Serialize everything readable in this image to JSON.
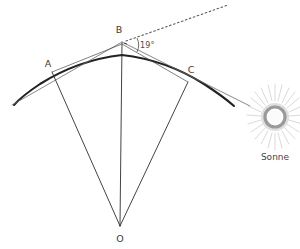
{
  "diagram": {
    "background_color": "#ffffff",
    "line_color": "#2b2b2b",
    "thin_line_color": "#555555",
    "label_color": "#3a3a3a",
    "sun_color": "#b9b9b9",
    "vertices": [
      {
        "id": "A",
        "label": "A",
        "x": 52,
        "y": 72,
        "label_x": 48,
        "label_y": 67
      },
      {
        "id": "B",
        "label": "B",
        "x": 122,
        "y": 44,
        "label_x": 119,
        "label_y": 33
      },
      {
        "id": "C",
        "label": "C",
        "x": 188,
        "y": 82,
        "label_x": 190,
        "label_y": 73
      },
      {
        "id": "O",
        "label": "O",
        "x": 120,
        "y": 226,
        "label_x": 120,
        "label_y": 240
      }
    ],
    "angle": {
      "value": "19",
      "unit": "°",
      "text": "19°",
      "label_x": 137,
      "label_y": 47,
      "at_vertex": "B"
    },
    "sun": {
      "label": "Sonne",
      "center_x": 275,
      "center_y": 117,
      "radius": 11,
      "label_x": 275,
      "label_y": 158,
      "ray_count": 28
    },
    "elements": {
      "earth_arc": "earth-surface-arc",
      "tangent_left": "tangent-line-a",
      "tangent_right": "tangent-line-c",
      "sun_ray_dotted": "dotted-sun-ray-b",
      "radius_oa": "radius-o-a",
      "radius_ob": "radius-o-b",
      "radius_oc": "radius-o-c",
      "chord_ab": "chord-a-b",
      "chord_bc": "chord-b-c"
    }
  }
}
